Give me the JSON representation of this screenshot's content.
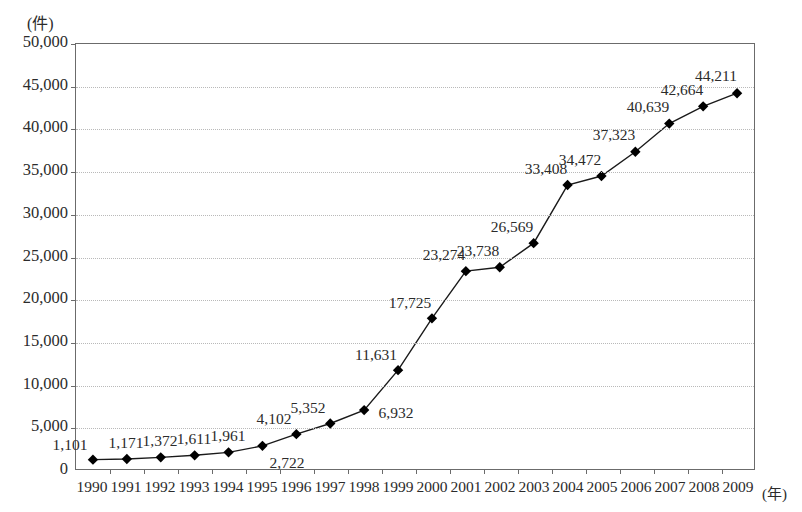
{
  "chart_data": {
    "type": "line",
    "title": "",
    "xlabel": "(年)",
    "ylabel": "(件)",
    "ylim": [
      0,
      50000
    ],
    "ytick_step": 5000,
    "yticks": [
      "0",
      "5,000",
      "10,000",
      "15,000",
      "20,000",
      "25,000",
      "30,000",
      "35,000",
      "40,000",
      "45,000",
      "50,000"
    ],
    "grid": true,
    "legend": "none",
    "marker": "diamond",
    "line_color": "#1a1a1a",
    "marker_color": "#000000",
    "grid_color": "#b9b9b9",
    "axis_color": "#6b6b6b",
    "categories": [
      "1990",
      "1991",
      "1992",
      "1993",
      "1994",
      "1995",
      "1996",
      "1997",
      "1998",
      "1999",
      "2000",
      "2001",
      "2002",
      "2003",
      "2004",
      "2005",
      "2006",
      "2007",
      "2008",
      "2009"
    ],
    "values": [
      1101,
      1171,
      1372,
      1611,
      1961,
      2722,
      4102,
      5352,
      6932,
      11631,
      17725,
      23274,
      23738,
      26569,
      33408,
      34472,
      37323,
      40639,
      42664,
      44211
    ],
    "point_labels": [
      "1,101",
      "1,171",
      "1,372",
      "1,611",
      "1,961",
      "2,722",
      "4,102",
      "5,352",
      "6,932",
      "11,631",
      "17,725",
      "23,274",
      "23,738",
      "26,569",
      "33,408",
      "34,472",
      "37,323",
      "40,639",
      "42,664",
      "44,211"
    ],
    "label_positions": [
      "above-left",
      "above",
      "above",
      "above",
      "above",
      "below-right",
      "above-left",
      "above-left",
      "right",
      "above-left",
      "above-left",
      "above-left",
      "above-left",
      "above-left",
      "above-left",
      "above-left",
      "above-left",
      "above-left",
      "above-left",
      "above-left"
    ]
  },
  "bottom_note": ""
}
